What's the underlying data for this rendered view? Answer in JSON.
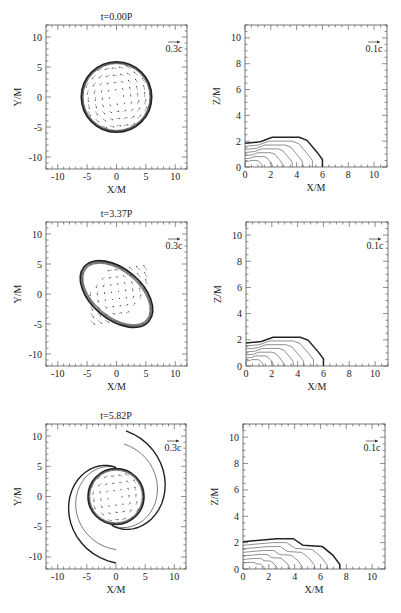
{
  "chart_data": [
    {
      "type": "contour",
      "panel": "row1-left",
      "title": "t=0.00P",
      "xlabel": "X/M",
      "ylabel": "Y/M",
      "xlim": [
        -12,
        12
      ],
      "ylim": [
        -12,
        12
      ],
      "xticks": [
        -10,
        -5,
        0,
        5,
        10
      ],
      "yticks": [
        -10,
        -5,
        0,
        5,
        10
      ],
      "vector_scale": "0.3c",
      "shape": "circular disk radius ~6M with rotating velocity field"
    },
    {
      "type": "contour",
      "panel": "row1-right",
      "title": "",
      "xlabel": "X/M",
      "ylabel": "Z/M",
      "xlim": [
        0,
        11
      ],
      "ylim": [
        0,
        11
      ],
      "xticks": [
        0,
        2,
        4,
        6,
        8,
        10
      ],
      "yticks": [
        0,
        2,
        4,
        6,
        8,
        10
      ],
      "vector_scale": "0.1c",
      "shape": "flattened star, surface height ~2.3M, equatorial radius ~6M"
    },
    {
      "type": "contour",
      "panel": "row2-left",
      "title": "t=3.37P",
      "xlabel": "X/M",
      "ylabel": "Y/M",
      "xlim": [
        -12,
        12
      ],
      "ylim": [
        -12,
        12
      ],
      "xticks": [
        -10,
        -5,
        0,
        5,
        10
      ],
      "yticks": [
        -10,
        -5,
        0,
        5,
        10
      ],
      "vector_scale": "0.3c",
      "shape": "bar-mode deformed ellipsoid, extent ~7M along diagonal"
    },
    {
      "type": "contour",
      "panel": "row2-right",
      "title": "",
      "xlabel": "X/M",
      "ylabel": "Z/M",
      "xlim": [
        0,
        11
      ],
      "ylim": [
        0,
        11
      ],
      "xticks": [
        0,
        2,
        4,
        6,
        8,
        10
      ],
      "yticks": [
        0,
        2,
        4,
        6,
        8,
        10
      ],
      "vector_scale": "0.1c",
      "shape": "surface height ~2.2M, equatorial radius ~6M"
    },
    {
      "type": "contour",
      "panel": "row3-left",
      "title": "t=5.82P",
      "xlabel": "X/M",
      "ylabel": "Y/M",
      "xlim": [
        -12,
        12
      ],
      "ylim": [
        -12,
        12
      ],
      "xticks": [
        -10,
        -5,
        0,
        5,
        10
      ],
      "yticks": [
        -10,
        -5,
        0,
        5,
        10
      ],
      "vector_scale": "0.3c",
      "shape": "central core radius ~5M with two spiral arms reaching ~11M"
    },
    {
      "type": "contour",
      "panel": "row3-right",
      "title": "",
      "xlabel": "X/M",
      "ylabel": "Z/M",
      "xlim": [
        0,
        11
      ],
      "ylim": [
        0,
        11
      ],
      "xticks": [
        0,
        2,
        4,
        6,
        8,
        10
      ],
      "yticks": [
        0,
        2,
        4,
        6,
        8,
        10
      ],
      "vector_scale": "0.1c",
      "shape": "surface height ~2.3M, equatorial radius ~7.5M"
    }
  ],
  "panels": {
    "row1": {
      "title": "t=0.00P",
      "xy_scale": "0.3c",
      "xz_scale": "0.1c"
    },
    "row2": {
      "title": "t=3.37P",
      "xy_scale": "0.3c",
      "xz_scale": "0.1c"
    },
    "row3": {
      "title": "t=5.82P",
      "xy_scale": "0.3c",
      "xz_scale": "0.1c"
    }
  },
  "labels": {
    "x": "X/M",
    "y": "Y/M",
    "z": "Z/M"
  },
  "ticks": {
    "xy": [
      "-10",
      "-5",
      "0",
      "5",
      "10"
    ],
    "xz_x": [
      "0",
      "2",
      "4",
      "6",
      "8",
      "10"
    ],
    "xz_z": [
      "0",
      "2",
      "4",
      "6",
      "8",
      "10"
    ]
  }
}
